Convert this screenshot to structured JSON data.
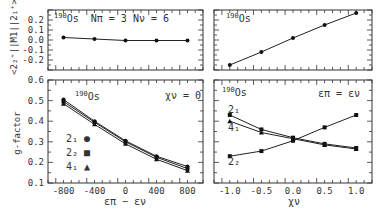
{
  "chart_data": [
    {
      "id": "top-left",
      "type": "line",
      "annotation": "190Os  Nπ = 3  Nν = 6",
      "nucleus": {
        "mass": "190",
        "symbol": "Os"
      },
      "params": "Nπ = 3   Nν = 6",
      "ylabel": "<2₂⁺||M1||2₁⁺>",
      "xlim": [
        -1000,
        1000
      ],
      "ylim": [
        -0.3,
        0.3
      ],
      "yticks": [
        "0.2",
        "0.1",
        "0.0",
        "-0.1",
        "-0.2"
      ],
      "x": [
        -800,
        -400,
        0,
        400,
        800
      ],
      "series": [
        {
          "name": "M1",
          "values": [
            0.025,
            0.01,
            -0.005,
            -0.005,
            -0.005
          ],
          "marker": "circle"
        }
      ]
    },
    {
      "id": "top-right",
      "type": "line",
      "annotation": "190Os",
      "nucleus": {
        "mass": "190",
        "symbol": "Os"
      },
      "xlim": [
        -1.25,
        1.25
      ],
      "ylim": [
        -0.3,
        0.3
      ],
      "x": [
        -1.0,
        -0.5,
        0.0,
        0.5,
        1.0
      ],
      "series": [
        {
          "name": "M1",
          "values": [
            -0.25,
            -0.12,
            0.02,
            0.15,
            0.27
          ],
          "marker": "circle"
        }
      ]
    },
    {
      "id": "bottom-left",
      "type": "line",
      "annotation": "190Os   χν = 0",
      "nucleus": {
        "mass": "190",
        "symbol": "Os"
      },
      "condition": "χν = 0",
      "xlabel": "επ − εν",
      "ylabel": "g-factor",
      "xlim": [
        -1000,
        1000
      ],
      "ylim": [
        0.1,
        0.6
      ],
      "xticks": [
        "-800",
        "-400",
        "0",
        "400",
        "800"
      ],
      "yticks": [
        "0.6",
        "0.5",
        "0.4",
        "0.3",
        "0.2",
        "0.1"
      ],
      "x": [
        -800,
        -400,
        0,
        400,
        800
      ],
      "legend": [
        {
          "label": "2",
          "sub": "1",
          "marker": "●"
        },
        {
          "label": "2",
          "sub": "2",
          "marker": "■"
        },
        {
          "label": "4",
          "sub": "1",
          "marker": "▲"
        }
      ],
      "series": [
        {
          "name": "2₁",
          "values": [
            0.505,
            0.4,
            0.305,
            0.23,
            0.18
          ],
          "marker": "circle"
        },
        {
          "name": "2₂",
          "values": [
            0.495,
            0.395,
            0.3,
            0.225,
            0.17
          ],
          "marker": "square"
        },
        {
          "name": "4₁",
          "values": [
            0.485,
            0.385,
            0.29,
            0.215,
            0.16
          ],
          "marker": "triangle"
        }
      ]
    },
    {
      "id": "bottom-right",
      "type": "line",
      "annotation": "190Os   επ = εν",
      "nucleus": {
        "mass": "190",
        "symbol": "Os"
      },
      "condition": "επ = εν",
      "xlabel": "χν",
      "xlim": [
        -1.25,
        1.25
      ],
      "ylim": [
        0.1,
        0.6
      ],
      "xticks": [
        "-1.0",
        "-0.5",
        "0.0",
        "0.5",
        "1.0"
      ],
      "x": [
        -1.0,
        -0.5,
        0.0,
        0.5,
        1.0
      ],
      "series": [
        {
          "name": "2₁",
          "values": [
            0.43,
            0.36,
            0.32,
            0.29,
            0.27
          ],
          "marker": "square"
        },
        {
          "name": "4₁",
          "values": [
            0.4,
            0.345,
            0.315,
            0.285,
            0.265
          ],
          "marker": "triangle"
        },
        {
          "name": "2₂",
          "values": [
            0.23,
            0.255,
            0.305,
            0.37,
            0.43
          ],
          "marker": "square"
        }
      ],
      "curve_labels": [
        {
          "label": "2",
          "sub": "1"
        },
        {
          "label": "4",
          "sub": "1"
        },
        {
          "label": "2",
          "sub": "2"
        }
      ]
    }
  ],
  "text": {
    "tl_mass": "190",
    "tl_sym": "Os",
    "tl_params": "Nπ = 3  Nν = 6",
    "tr_mass": "190",
    "tr_sym": "Os",
    "bl_mass": "190",
    "bl_sym": "Os",
    "bl_cond": "χν = 0",
    "br_mass": "190",
    "br_sym": "Os",
    "br_cond": "επ = εν",
    "ylabel_top": "<2₂⁺||M1||2₁⁺>",
    "ylabel_bottom": "g-factor",
    "xlabel_left": "επ − εν",
    "xlabel_right": "χν",
    "leg1": "2₁",
    "leg2": "2₂",
    "leg3": "4₁",
    "br_l1": "2₁",
    "br_l2": "4₁",
    "br_l3": "2₂"
  }
}
